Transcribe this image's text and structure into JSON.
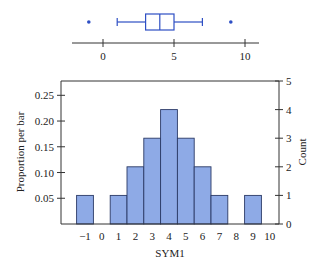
{
  "chart_data": [
    {
      "type": "box",
      "title": "",
      "orientation": "horizontal",
      "stats": {
        "whisker_low": 1,
        "q1": 3,
        "median": 4,
        "q3": 5,
        "whisker_high": 7
      },
      "outliers": [
        -1,
        9
      ],
      "xticks": [
        0,
        5,
        10
      ],
      "xtick_labels": [
        "0",
        "5",
        "10"
      ],
      "xlim": [
        -2.2,
        11
      ],
      "color": "#2e4fc4"
    },
    {
      "type": "bar",
      "title": "",
      "xlabel": "SYM1",
      "ylabel": "Proportion per bar",
      "y2label": "Count",
      "categories": [
        -1,
        0,
        1,
        2,
        3,
        4,
        5,
        6,
        7,
        8,
        9
      ],
      "counts": [
        1,
        0,
        1,
        2,
        3,
        4,
        3,
        2,
        1,
        0,
        1
      ],
      "proportions": [
        0.0556,
        0,
        0.0556,
        0.1111,
        0.1667,
        0.2222,
        0.1667,
        0.1111,
        0.0556,
        0,
        0.0556
      ],
      "xticks": [
        -1,
        0,
        1,
        2,
        3,
        4,
        5,
        6,
        7,
        8,
        9,
        10
      ],
      "xtick_labels": [
        "−1",
        "0",
        "1",
        "2",
        "3",
        "4",
        "5",
        "6",
        "7",
        "8",
        "9",
        "10"
      ],
      "yticks": [
        0.05,
        0.1,
        0.15,
        0.2,
        0.25
      ],
      "ytick_labels": [
        "0.05",
        "0.10",
        "0.15",
        "0.20",
        "0.25"
      ],
      "y2ticks": [
        0,
        1,
        2,
        3,
        4,
        5
      ],
      "y2tick_labels": [
        "0",
        "1",
        "2",
        "3",
        "4",
        "5"
      ],
      "count_lim": [
        0,
        5
      ],
      "total": 18,
      "bar_color": "#8eaae6",
      "edge_color": "#2b3a66"
    }
  ]
}
